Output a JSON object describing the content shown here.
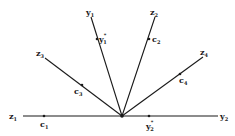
{
  "diagram": {
    "origin": {
      "x": 122,
      "y": 116
    },
    "colors": {
      "ink": "#1a1a1a",
      "background": "#ffffff"
    },
    "rays": [
      {
        "id": "z1",
        "end": {
          "x": 23,
          "y": 116
        },
        "label": "z",
        "sub": "1"
      },
      {
        "id": "y2",
        "end": {
          "x": 218,
          "y": 116
        },
        "label": "y",
        "sub": "2"
      },
      {
        "id": "y1",
        "end": {
          "x": 91,
          "y": 17
        },
        "label": "y",
        "sub": "1"
      },
      {
        "id": "z2",
        "end": {
          "x": 155,
          "y": 17
        },
        "label": "z",
        "sub": "2"
      },
      {
        "id": "z3",
        "end": {
          "x": 45,
          "y": 58
        },
        "label": "z",
        "sub": "3"
      },
      {
        "id": "z4",
        "end": {
          "x": 203,
          "y": 57
        },
        "label": "z",
        "sub": "4"
      }
    ],
    "points": [
      {
        "id": "c1",
        "x": 44,
        "y": 116,
        "label": "c",
        "sub": "1",
        "sup": ""
      },
      {
        "id": "y2star",
        "x": 149,
        "y": 116,
        "label": "y",
        "sub": "2",
        "sup": "*"
      },
      {
        "id": "y1star",
        "x": 97,
        "y": 39,
        "label": "y",
        "sub": "1",
        "sup": "*"
      },
      {
        "id": "c2",
        "x": 149,
        "y": 39,
        "label": "c",
        "sub": "2",
        "sup": ""
      },
      {
        "id": "c3",
        "x": 82,
        "y": 85,
        "label": "c",
        "sub": "3",
        "sup": ""
      },
      {
        "id": "c4",
        "x": 180,
        "y": 74,
        "label": "c",
        "sub": "4",
        "sup": ""
      }
    ],
    "labels": {
      "z1": {
        "text": "z",
        "sub": "1"
      },
      "y2": {
        "text": "y",
        "sub": "2"
      },
      "y1": {
        "text": "y",
        "sub": "1"
      },
      "z2": {
        "text": "z",
        "sub": "2"
      },
      "z3": {
        "text": "z",
        "sub": "3"
      },
      "z4": {
        "text": "z",
        "sub": "4"
      },
      "c1": {
        "text": "c",
        "sub": "1"
      },
      "c2": {
        "text": "c",
        "sub": "2"
      },
      "c3": {
        "text": "c",
        "sub": "3"
      },
      "c4": {
        "text": "c",
        "sub": "4"
      },
      "y1star": {
        "text": "y",
        "sub": "1",
        "sup": "*"
      },
      "y2star": {
        "text": "y",
        "sub": "2",
        "sup": "*"
      }
    }
  }
}
